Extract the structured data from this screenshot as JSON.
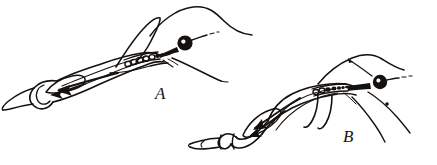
{
  "figure": {
    "domain": "scientific-line-engraving",
    "medium": "ink line drawing / engraving",
    "background_color": "#ffffff",
    "ink_color": "#15110f",
    "width": 437,
    "height": 165,
    "caption_labels": [
      "A",
      "B"
    ]
  },
  "panels": [
    {
      "id": "A",
      "label": "A",
      "label_position": {
        "x": 155,
        "y": 85
      },
      "orientation": "lower-left to upper-right",
      "parts": [
        {
          "name": "head-bulb",
          "type": "filled-ellipse",
          "color": "#15110f"
        },
        {
          "name": "beaded-chain",
          "type": "segmented-oval-row",
          "bead_count": 9
        },
        {
          "name": "body-outline",
          "type": "stroke-contour"
        },
        {
          "name": "internal-duct",
          "type": "stroke-contour"
        },
        {
          "name": "flow-arrow",
          "type": "arrow",
          "direction": "left"
        },
        {
          "name": "tail-tip",
          "type": "stroke-contour"
        },
        {
          "name": "dorsal-filament",
          "type": "stroke-curve"
        },
        {
          "name": "ventral-filament",
          "type": "stroke-curve"
        },
        {
          "name": "antenna-filament",
          "type": "stroke-curve"
        }
      ]
    },
    {
      "id": "B",
      "label": "B",
      "label_position": {
        "x": 343,
        "y": 128
      },
      "orientation": "lower-left to upper-right",
      "parts": [
        {
          "name": "head-bulb",
          "type": "filled-ellipse",
          "color": "#15110f"
        },
        {
          "name": "beaded-chain",
          "type": "segmented-oval-row",
          "bead_count": 7
        },
        {
          "name": "body-outline",
          "type": "stroke-contour"
        },
        {
          "name": "internal-duct",
          "type": "stroke-contour"
        },
        {
          "name": "flow-arrow",
          "type": "arrow",
          "direction": "left"
        },
        {
          "name": "tail-tip",
          "type": "stroke-contour"
        },
        {
          "name": "dorsal-filament",
          "type": "stroke-curve"
        },
        {
          "name": "ventral-filament",
          "type": "stroke-curve"
        },
        {
          "name": "trailing-filament-upper",
          "type": "stroke-curve"
        },
        {
          "name": "trailing-filament-lower",
          "type": "stroke-curve"
        }
      ]
    }
  ]
}
